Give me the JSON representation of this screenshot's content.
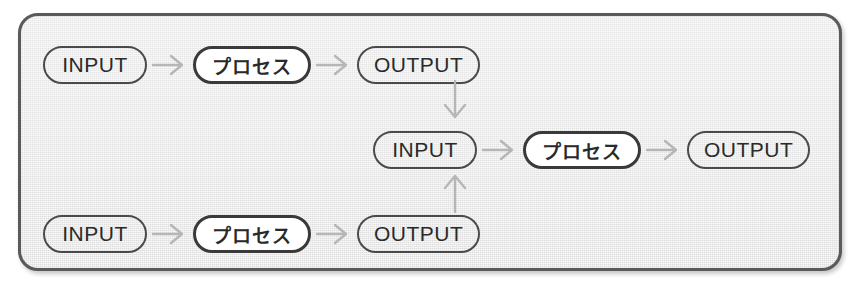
{
  "diagram": {
    "colors": {
      "panel_fill": "#e9e9e9",
      "panel_border": "#5a5a5a",
      "pill_border": "#4a4a4a",
      "process_pill_border": "#3a3a3a",
      "process_pill_fill": "#ffffff",
      "arrow": "#b6b6b6",
      "text": "#2a2a2a"
    },
    "labels": {
      "input": "INPUT",
      "process": "プロセス",
      "output": "OUTPUT"
    },
    "rows": [
      {
        "id": "row-top",
        "nodes": [
          {
            "type": "input",
            "label": "INPUT"
          },
          {
            "type": "process",
            "label": "プロセス"
          },
          {
            "type": "output",
            "label": "OUTPUT"
          }
        ]
      },
      {
        "id": "row-middle",
        "nodes": [
          {
            "type": "input",
            "label": "INPUT"
          },
          {
            "type": "process",
            "label": "プロセス"
          },
          {
            "type": "output",
            "label": "OUTPUT"
          }
        ]
      },
      {
        "id": "row-bottom",
        "nodes": [
          {
            "type": "input",
            "label": "INPUT"
          },
          {
            "type": "process",
            "label": "プロセス"
          },
          {
            "type": "output",
            "label": "OUTPUT"
          }
        ]
      }
    ],
    "connectors": [
      {
        "id": "top-output-to-middle-input",
        "direction": "down",
        "glyph": "↓"
      },
      {
        "id": "bottom-output-to-middle-input",
        "direction": "up",
        "glyph": "↑"
      }
    ]
  }
}
